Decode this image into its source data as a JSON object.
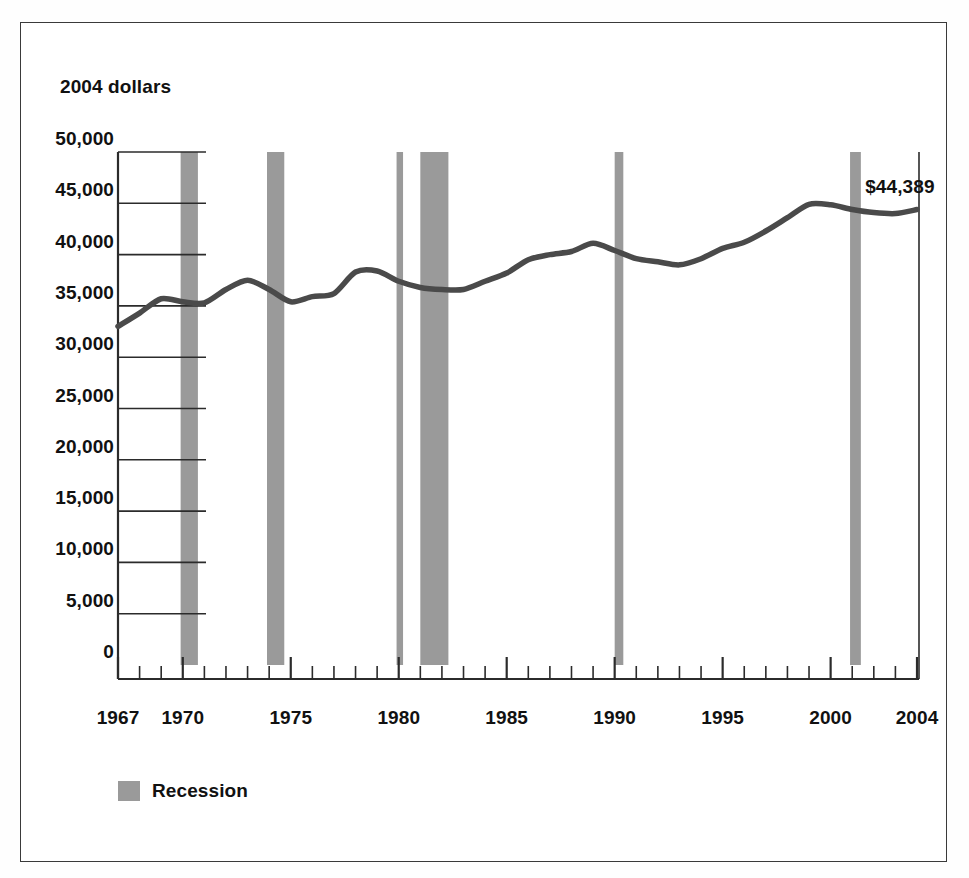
{
  "chart_data": {
    "type": "line",
    "title": "",
    "subtitle": "",
    "xlabel": "",
    "ylabel": "2004 dollars",
    "ylim": [
      0,
      50000
    ],
    "xlim": [
      1967,
      2004
    ],
    "grid": false,
    "y_ticks": [
      0,
      5000,
      10000,
      15000,
      20000,
      25000,
      30000,
      35000,
      40000,
      45000,
      50000
    ],
    "y_tick_labels": [
      "0",
      "5,000",
      "10,000",
      "15,000",
      "20,000",
      "25,000",
      "30,000",
      "35,000",
      "40,000",
      "45,000",
      "50,000"
    ],
    "x_ticks": [
      1967,
      1970,
      1975,
      1980,
      1985,
      1990,
      1995,
      2000,
      2004
    ],
    "x_tick_labels": [
      "1967",
      "1970",
      "1975",
      "1980",
      "1985",
      "1990",
      "1995",
      "2000",
      "2004"
    ],
    "x_minor_tick_interval": 1,
    "legend_position": "below-plot-left",
    "legend": [
      {
        "label": "Recession",
        "color": "#9a9a9a",
        "marker": "square"
      }
    ],
    "annotations": [
      {
        "text": "$44,389",
        "x": 2001.6,
        "y": 46400,
        "anchor": "left"
      }
    ],
    "series": [
      {
        "name": "Median household income",
        "color": "#4a4a4a",
        "x": [
          1967,
          1968,
          1969,
          1970,
          1971,
          1972,
          1973,
          1974,
          1975,
          1976,
          1977,
          1978,
          1979,
          1980,
          1981,
          1982,
          1983,
          1984,
          1985,
          1986,
          1987,
          1988,
          1989,
          1990,
          1991,
          1992,
          1993,
          1994,
          1995,
          1996,
          1997,
          1998,
          1999,
          2000,
          2001,
          2002,
          2003,
          2004
        ],
        "values": [
          33000,
          34300,
          35700,
          35400,
          35300,
          36600,
          37500,
          36600,
          35400,
          35900,
          36200,
          38300,
          38400,
          37400,
          36800,
          36600,
          36600,
          37400,
          38200,
          39500,
          40000,
          40300,
          41100,
          40400,
          39600,
          39300,
          39000,
          39600,
          40600,
          41200,
          42300,
          43600,
          44900,
          44850,
          44400,
          44100,
          44000,
          44389
        ]
      }
    ],
    "recession_bands": [
      {
        "start": 1969.9,
        "end": 1970.7,
        "label": "1969-70"
      },
      {
        "start": 1973.9,
        "end": 1974.7,
        "label": "1973-75"
      },
      {
        "start": 1979.9,
        "end": 1980.2,
        "label": "1980"
      },
      {
        "start": 1981.0,
        "end": 1982.3,
        "label": "1981-82"
      },
      {
        "start": 1990.0,
        "end": 1990.4,
        "label": "1990-91"
      },
      {
        "start": 2000.9,
        "end": 2001.4,
        "label": "2001"
      }
    ],
    "band_color": "#9a9a9a",
    "line_color": "#4a4a4a",
    "axis_color": "#2b2b2b"
  }
}
